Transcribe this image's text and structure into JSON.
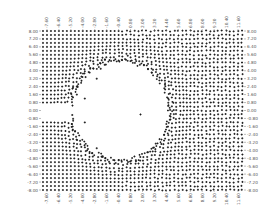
{
  "chart_data": {
    "type": "scatter",
    "title": "",
    "xlabel": "",
    "ylabel": "",
    "xlim": [
      -8.2,
      12.2
    ],
    "ylim": [
      -8.0,
      8.0
    ],
    "grid": false,
    "legend": null,
    "marker": "+",
    "marker_color": "#1a1a1a",
    "x_ticks": [
      "-7.60",
      "-6.40",
      "-5.20",
      "-4.00",
      "-2.80",
      "-1.60",
      "-0.40",
      "0.80",
      "2.00",
      "3.20",
      "4.40",
      "5.60",
      "6.80",
      "8.00",
      "9.20",
      "10.40",
      "11.60"
    ],
    "y_ticks": [
      "8.00",
      "7.20",
      "6.40",
      "5.60",
      "4.80",
      "4.00",
      "3.20",
      "2.40",
      "1.60",
      "0.80",
      "0.00",
      "-0.80",
      "-1.60",
      "-2.40",
      "-3.20",
      "-4.00",
      "-4.80",
      "-5.60",
      "-6.40",
      "-7.20",
      "-8.00"
    ],
    "tick_axes": {
      "x": [
        "top",
        "bottom"
      ],
      "y": [
        "left",
        "right"
      ]
    },
    "grid_points": {
      "x_start": -8.0,
      "x_end": 12.0,
      "x_step": 0.4,
      "y_start": -8.0,
      "y_end": 8.0,
      "y_step": 0.4
    },
    "void_circle": {
      "cx": -0.2,
      "cy": 0.0,
      "r": 4.6
    },
    "inlet_channel": {
      "x_min": -8.2,
      "x_max": -4.8,
      "y_min": -0.8,
      "y_max": 0.8
    },
    "stray_points": [
      [
        -4.6,
        2.4
      ],
      [
        -4.6,
        1.6
      ],
      [
        -3.8,
        1.2
      ],
      [
        -2.6,
        3.2
      ],
      [
        -2.2,
        4.2
      ],
      [
        -3.8,
        -1.2
      ],
      [
        -2.6,
        -3.8
      ],
      [
        -2.0,
        -4.6
      ],
      [
        1.8,
        -0.4
      ],
      [
        -1.8,
        4.6
      ]
    ],
    "boundary_cluster": {
      "radius_band": [
        4.6,
        5.4
      ],
      "density_boost": true
    }
  }
}
